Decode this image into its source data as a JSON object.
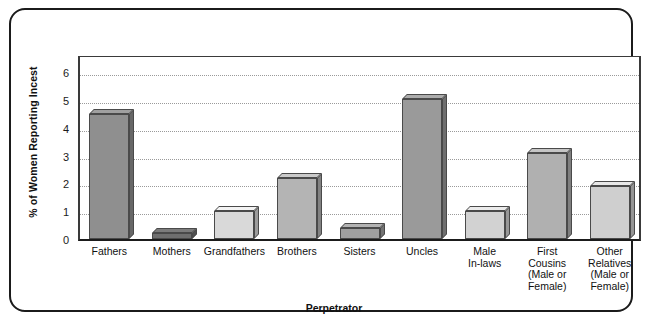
{
  "chart_data": {
    "type": "bar",
    "title": "",
    "xlabel": "Perpetrator",
    "ylabel": "% of Women Reporting Incest",
    "categories": [
      "Fathers",
      "Mothers",
      "Grandfathers",
      "Brothers",
      "Sisters",
      "Uncles",
      "Male\nIn-laws",
      "First\nCousins\n(Male or\nFemale)",
      "Other\nRelatives\n(Male or\nFemale)"
    ],
    "values": [
      4.5,
      0.2,
      1.0,
      2.2,
      0.4,
      5.05,
      1.0,
      3.1,
      1.9
    ],
    "bar_colors": [
      "#8f8f8f",
      "#6f6f6f",
      "#d9d9d9",
      "#b4b4b4",
      "#a0a0a0",
      "#9a9a9a",
      "#d2d2d2",
      "#b0b0b0",
      "#cfcfcf"
    ],
    "yticks": [
      0,
      1,
      2,
      3,
      4,
      5,
      6
    ],
    "ylim": [
      0,
      6.65
    ],
    "grid": true,
    "legend": "none"
  },
  "axis": {
    "y_title": "% of Women Reporting Incest",
    "x_title": "Perpetrator",
    "tick_labels": [
      "0",
      "1",
      "2",
      "3",
      "4",
      "5",
      "6"
    ]
  },
  "categories_display": [
    [
      "Fathers"
    ],
    [
      "Mothers"
    ],
    [
      "Grandfathers"
    ],
    [
      "Brothers"
    ],
    [
      "Sisters"
    ],
    [
      "Uncles"
    ],
    [
      "Male",
      "In-laws"
    ],
    [
      "First",
      "Cousins",
      "(Male or",
      "Female)"
    ],
    [
      "Other",
      "Relatives",
      "(Male or",
      "Female)"
    ]
  ]
}
